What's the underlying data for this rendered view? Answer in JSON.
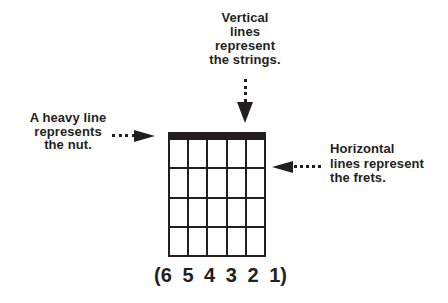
{
  "colors": {
    "ink": "#231f20",
    "background": "#ffffff"
  },
  "annotations": {
    "strings": {
      "lines": [
        "Vertical",
        "lines",
        "represent",
        "the strings."
      ]
    },
    "nut": {
      "lines": [
        "A heavy line",
        "represents",
        "the nut."
      ]
    },
    "frets": {
      "lines": [
        "Horizontal",
        "lines represent",
        "the frets."
      ]
    }
  },
  "diagram": {
    "type": "guitar-chord-grid",
    "strings": 6,
    "frets": 4,
    "string_numbers": [
      "(6",
      "5",
      "4",
      "3",
      "2",
      "1)"
    ]
  }
}
